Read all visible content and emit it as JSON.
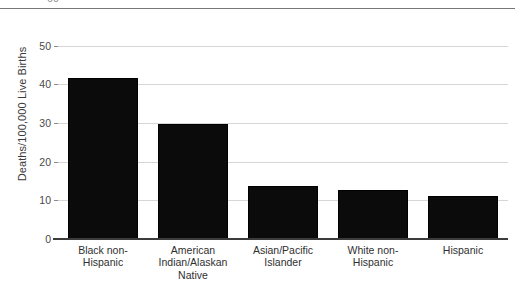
{
  "chart_data": {
    "type": "bar",
    "title": "",
    "subtitle": "",
    "xlabel": "",
    "ylabel": "Deaths/100,000 Live Births",
    "categories": [
      "Black non-Hispanic",
      "American Indian/Alaskan Native",
      "Asian/Pacific Islander",
      "White non-Hispanic",
      "Hispanic"
    ],
    "values": [
      42,
      30,
      14,
      13,
      11.5
    ],
    "ylim": [
      0,
      60
    ],
    "yticks": [
      0,
      10,
      20,
      30,
      40,
      50,
      60
    ],
    "ytick_labels": [
      "0",
      "10",
      "20",
      "30",
      "40",
      "50",
      "60"
    ],
    "grid": true,
    "legend": "none",
    "bar_color": "#0b0b0b",
    "gridline_color": "#d6d6d6",
    "axis_color": "#3c3c3c"
  },
  "axes": {
    "y_title": "Deaths/100,000 Live Births",
    "top_clipped_tick": "60"
  },
  "category_lines": [
    [
      "Black non-",
      "Hispanic"
    ],
    [
      "American",
      "Indian/Alaskan",
      "Native"
    ],
    [
      "Asian/Pacific",
      "Islander"
    ],
    [
      "White non-",
      "Hispanic"
    ],
    [
      "Hispanic"
    ]
  ]
}
